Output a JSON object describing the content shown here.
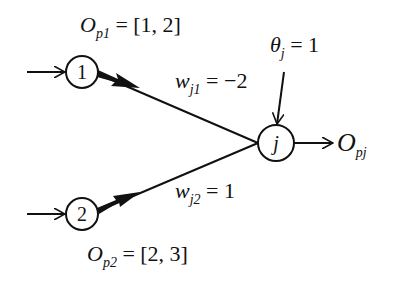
{
  "diagram": {
    "nodes": [
      {
        "id": "1",
        "label": "1",
        "italic": false
      },
      {
        "id": "2",
        "label": "2",
        "italic": false
      },
      {
        "id": "j",
        "label": "j",
        "italic": true
      }
    ],
    "labels": {
      "op1": {
        "main": "O",
        "sub": "p1",
        "rest": " = [1, 2]"
      },
      "op2": {
        "main": "O",
        "sub": "p2",
        "rest": " = [2, 3]"
      },
      "wj1": {
        "main": "w",
        "sub": "j1",
        "rest": " = −2"
      },
      "wj2": {
        "main": "w",
        "sub": "j2",
        "rest": " = 1"
      },
      "theta": {
        "main": "θ",
        "sub": "j",
        "rest": " = 1"
      },
      "opj": {
        "main": "O",
        "sub": "pj",
        "rest": ""
      }
    },
    "edges": [
      {
        "from": "input",
        "to": "1",
        "style": "open-arrow"
      },
      {
        "from": "input",
        "to": "2",
        "style": "open-arrow"
      },
      {
        "from": "1",
        "to": "j",
        "weight": "-2",
        "style": "thick-arrow"
      },
      {
        "from": "2",
        "to": "j",
        "weight": "1",
        "style": "thick-arrow"
      },
      {
        "from": "theta",
        "to": "j",
        "style": "open-arrow"
      },
      {
        "from": "j",
        "to": "output",
        "style": "open-arrow"
      }
    ],
    "colors": {
      "stroke": "#111111",
      "background": "#ffffff"
    }
  }
}
